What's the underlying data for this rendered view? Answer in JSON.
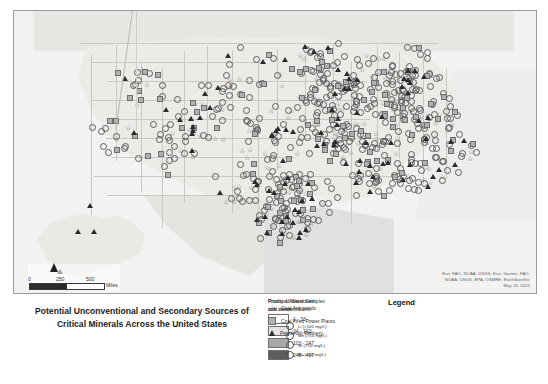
{
  "title": {
    "line1": "Potential Unconventional and Secondary Sources of",
    "line2": "Critical Minerals Across the United States"
  },
  "map": {
    "scalebar": {
      "tick_0": "0",
      "tick_mid": "250",
      "tick_max": "500",
      "unit": "Miles"
    },
    "north_arrow": "north-arrow",
    "attribution_line1": "Esri, FAO, NOAA, USGS, Esri, Garmin, FAO,",
    "attribution_line2": "NOAA, USGS, EPA, OSMRE, EarthSatellite",
    "attribution_line3": "May 23, 2022"
  },
  "legend": {
    "title": "Legend",
    "coal_mines": {
      "header_line1": "Priority 1 Abandoned",
      "header_line2": "coal mines",
      "classes": [
        {
          "label": "1 - 33",
          "color": "#ffffff"
        },
        {
          "label": "34 - 102",
          "color": "#e3e3e3"
        },
        {
          "label": "103 - 247",
          "color": "#a8a8a8"
        },
        {
          "label": "248 - 497",
          "color": "#5d5d5d"
        }
      ]
    },
    "water_samples": {
      "header_line1": "Produced Water Samples",
      "header_line2": "with concentrations",
      "items": [
        {
          "label": "Li (>100 mg/L)"
        },
        {
          "label": "Mn (>10 mg/L)"
        },
        {
          "label": "Sr (>10 mg/L)"
        },
        {
          "label": "Ba (>10 mg/L)"
        }
      ]
    },
    "symbols": [
      {
        "icon": "star-icon",
        "label": "Coal Ash ponds"
      },
      {
        "icon": "square-icon",
        "label": "Coal Fired Power Plants"
      },
      {
        "icon": "triangle-icon",
        "label": "Petroleum Refinery"
      }
    ]
  },
  "chart_data": {
    "type": "map",
    "title": "Potential Unconventional and Secondary Sources of Critical Minerals Across the United States",
    "projection": "Continental United States with Alaska inset",
    "layers": [
      {
        "name": "Priority 1 Abandoned coal mines",
        "symbology": "choropleth",
        "classes": [
          "1 - 33",
          "34 - 102",
          "103 - 247",
          "248 - 497"
        ],
        "colors": [
          "#ffffff",
          "#e3e3e3",
          "#a8a8a8",
          "#5d5d5d"
        ]
      },
      {
        "name": "Produced Water Samples with concentrations",
        "symbology": "circle",
        "classes": [
          "Li (>100 mg/L)",
          "Mn (>10 mg/L)",
          "Sr (>10 mg/L)",
          "Ba (>10 mg/L)"
        ]
      },
      {
        "name": "Coal Ash ponds",
        "symbology": "star"
      },
      {
        "name": "Coal Fired Power Plants",
        "symbology": "square"
      },
      {
        "name": "Petroleum Refinery",
        "symbology": "triangle"
      }
    ],
    "scale": {
      "min": 0,
      "mid": 250,
      "max": 500,
      "unit": "Miles"
    },
    "date": "May 23, 2022"
  }
}
